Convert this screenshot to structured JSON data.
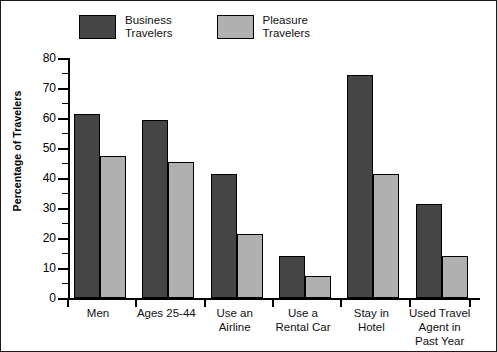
{
  "chart_data": {
    "type": "bar",
    "title": "",
    "subtitle": "",
    "xlabel": "",
    "ylabel": "Percentage of Travelers",
    "ylim": [
      0,
      80
    ],
    "ytick_step": 10,
    "yminor_step": 5,
    "grid": false,
    "legend_position": "top-left",
    "categories": [
      "Men",
      "Ages 25-44",
      "Use an\nAirline",
      "Use a\nRental Car",
      "Stay in\nHotel",
      "Used Travel\nAgent in Past Year"
    ],
    "ytick_labels": [
      "0",
      "10",
      "20",
      "30",
      "40",
      "50",
      "60",
      "70",
      "80"
    ],
    "ytick_values": [
      0,
      10,
      20,
      30,
      40,
      50,
      60,
      70,
      80
    ],
    "series": [
      {
        "name": "Business\nTravelers",
        "color": "#454545",
        "values": [
          61.5,
          59.5,
          41.5,
          14,
          74.5,
          31.5
        ]
      },
      {
        "name": "Pleasure\nTravelers",
        "color": "#b0b0b0",
        "values": [
          47.5,
          45.5,
          21.5,
          7.5,
          41.5,
          14
        ]
      }
    ]
  },
  "legend": {
    "entries": [
      {
        "label": "Business\nTravelers",
        "color": "#454545"
      },
      {
        "label": "Pleasure\nTravelers",
        "color": "#b0b0b0"
      }
    ]
  },
  "axis": {
    "y_title": "Percentage of Travelers"
  }
}
